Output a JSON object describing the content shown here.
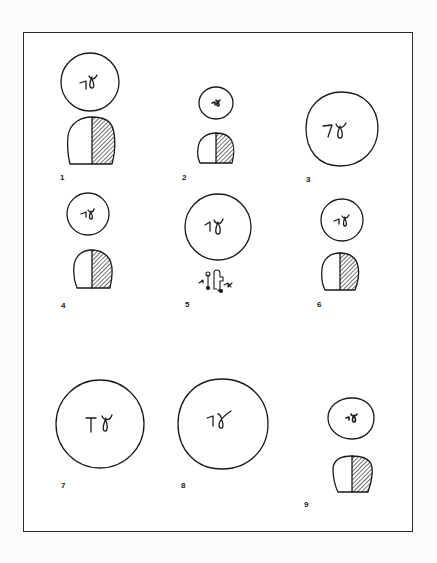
{
  "figure": {
    "panel_count": 9,
    "colors": {
      "ink": "#1a1a1a",
      "frame": "#2a2a2a",
      "paper": "#ffffff",
      "hatch": "#333333"
    },
    "panels": [
      {
        "label": "1",
        "seal_inscription": "ʔɣ",
        "has_profile": true
      },
      {
        "label": "2",
        "seal_inscription": "ʔɣ",
        "has_profile": true
      },
      {
        "label": "3",
        "seal_inscription": "ʔɣ",
        "has_profile": false
      },
      {
        "label": "4",
        "seal_inscription": "ʔɣ",
        "has_profile": true
      },
      {
        "label": "5",
        "seal_inscription": "ʔɣ",
        "has_profile": false,
        "has_figure_glyph": true
      },
      {
        "label": "6",
        "seal_inscription": "ʔɣ",
        "has_profile": true
      },
      {
        "label": "7",
        "seal_inscription": "Tɣ",
        "has_profile": false
      },
      {
        "label": "8",
        "seal_inscription": "ʔɣ",
        "has_profile": false
      },
      {
        "label": "9",
        "seal_inscription": "ɣ",
        "has_profile": true
      }
    ]
  }
}
